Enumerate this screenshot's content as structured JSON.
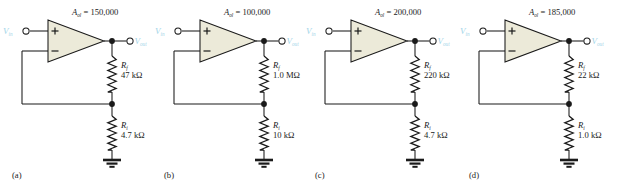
{
  "figure": {
    "type": "op-amp non-inverting amplifier circuits",
    "count": 4,
    "accent_label_color": "#9fd4e8",
    "opamp_fill_color": "#ecead9",
    "wire_color": "#1a1a1a"
  },
  "circuits": [
    {
      "caption": "(a)",
      "gain_label": "A",
      "gain_sub": "ol",
      "gain_eq": " = 150,000",
      "gain_value": "150,000",
      "input_label": "V",
      "input_sub": "in",
      "output_label": "V",
      "output_sub": "out",
      "plus_sign": "+",
      "minus_sign": "−",
      "rf_label": "R",
      "rf_sub": "f",
      "rf_value": "47 kΩ",
      "ri_label": "R",
      "ri_sub": "i",
      "ri_value": "4.7 kΩ",
      "ground": "ground-symbol"
    },
    {
      "caption": "(b)",
      "gain_label": "A",
      "gain_sub": "ol",
      "gain_eq": " = 100,000",
      "gain_value": "100,000",
      "input_label": "V",
      "input_sub": "in",
      "output_label": "V",
      "output_sub": "out",
      "plus_sign": "+",
      "minus_sign": "−",
      "rf_label": "R",
      "rf_sub": "f",
      "rf_value": "1.0 MΩ",
      "ri_label": "R",
      "ri_sub": "i",
      "ri_value": "10 kΩ",
      "ground": "ground-symbol"
    },
    {
      "caption": "(c)",
      "gain_label": "A",
      "gain_sub": "ol",
      "gain_eq": " = 200,000",
      "gain_value": "200,000",
      "input_label": "V",
      "input_sub": "in",
      "output_label": "V",
      "output_sub": "out",
      "plus_sign": "+",
      "minus_sign": "−",
      "rf_label": "R",
      "rf_sub": "f",
      "rf_value": "220 kΩ",
      "ri_label": "R",
      "ri_sub": "i",
      "ri_value": "4.7 kΩ",
      "ground": "ground-symbol"
    },
    {
      "caption": "(d)",
      "gain_label": "A",
      "gain_sub": "ol",
      "gain_eq": " = 185,000",
      "gain_value": "185,000",
      "input_label": "V",
      "input_sub": "in",
      "output_label": "V",
      "output_sub": "out",
      "plus_sign": "+",
      "minus_sign": "−",
      "rf_label": "R",
      "rf_sub": "f",
      "rf_value": "22 kΩ",
      "ri_label": "R",
      "ri_sub": "i",
      "ri_value": "1.0 kΩ",
      "ground": "ground-symbol"
    }
  ]
}
